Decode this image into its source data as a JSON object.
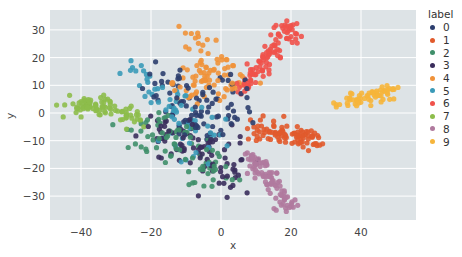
{
  "chart_data": {
    "type": "scatter",
    "title": "",
    "xlabel": "x",
    "ylabel": "y",
    "xlim": [
      -48,
      57
    ],
    "ylim": [
      -38,
      37
    ],
    "xticks": [
      -40,
      -20,
      0,
      20,
      40
    ],
    "yticks": [
      30,
      20,
      10,
      0,
      -10,
      -20,
      -30
    ],
    "grid": true,
    "background": "#dde3e6",
    "legend": {
      "title": "label",
      "position": "right-outside",
      "entries": [
        "0",
        "1",
        "2",
        "3",
        "4",
        "5",
        "6",
        "7",
        "8",
        "9"
      ]
    },
    "colors": {
      "0": "#2c3e6e",
      "1": "#e15a2c",
      "2": "#3f8f6a",
      "3": "#3a2d5c",
      "4": "#f0923a",
      "5": "#3a9ab8",
      "6": "#f0524b",
      "7": "#8dbd4b",
      "8": "#b07a9e",
      "9": "#f6b53b"
    },
    "series": [
      {
        "name": "0",
        "arm": [
          [
            -22,
            15
          ],
          [
            -10,
            5
          ],
          [
            -3,
            -5
          ],
          [
            3,
            10
          ]
        ],
        "spread": 4.5,
        "n": 90
      },
      {
        "name": "1",
        "arm": [
          [
            10,
            -5
          ],
          [
            18,
            -8
          ],
          [
            28,
            -10
          ]
        ],
        "spread": 1.8,
        "n": 90
      },
      {
        "name": "2",
        "arm": [
          [
            -25,
            -8
          ],
          [
            -15,
            -5
          ],
          [
            -3,
            -20
          ],
          [
            -1,
            -25
          ]
        ],
        "spread": 3.5,
        "n": 80
      },
      {
        "name": "3",
        "arm": [
          [
            -20,
            -5
          ],
          [
            -8,
            -10
          ],
          [
            0,
            -18
          ],
          [
            2,
            -24
          ]
        ],
        "spread": 4,
        "n": 90
      },
      {
        "name": "4",
        "arm": [
          [
            -7,
            28
          ],
          [
            -4,
            20
          ],
          [
            0,
            15
          ],
          [
            -10,
            10
          ],
          [
            6,
            10
          ]
        ],
        "spread": 3,
        "n": 90
      },
      {
        "name": "5",
        "arm": [
          [
            -24,
            16
          ],
          [
            -18,
            8
          ],
          [
            -12,
            -2
          ],
          [
            -6,
            -12
          ]
        ],
        "spread": 4,
        "n": 70
      },
      {
        "name": "6",
        "arm": [
          [
            5,
            8
          ],
          [
            10,
            15
          ],
          [
            15,
            22
          ],
          [
            20,
            32
          ]
        ],
        "spread": 1.8,
        "n": 100
      },
      {
        "name": "7",
        "arm": [
          [
            -44,
            2
          ],
          [
            -34,
            3
          ],
          [
            -28,
            0
          ],
          [
            -25,
            -3
          ]
        ],
        "spread": 1.8,
        "n": 90
      },
      {
        "name": "8",
        "arm": [
          [
            8,
            -15
          ],
          [
            12,
            -22
          ],
          [
            16,
            -28
          ],
          [
            20,
            -34
          ]
        ],
        "spread": 1.6,
        "n": 90
      },
      {
        "name": "9",
        "arm": [
          [
            33,
            3
          ],
          [
            40,
            5
          ],
          [
            50,
            9
          ]
        ],
        "spread": 1.5,
        "n": 60
      }
    ]
  }
}
